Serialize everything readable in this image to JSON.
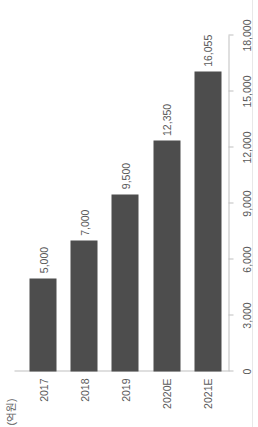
{
  "chart_data": {
    "type": "bar",
    "orientation": "vertical",
    "title": "",
    "subtitle": "",
    "xlabel": "",
    "ylabel": "(억원)",
    "unit_label": "(억원)",
    "categories": [
      "2017",
      "2018",
      "2019",
      "2020E",
      "2021E"
    ],
    "values": [
      5000,
      7000,
      9500,
      12350,
      16055
    ],
    "value_labels": [
      "5,000",
      "7,000",
      "9,500",
      "12,350",
      "16,055"
    ],
    "ylim": [
      0,
      18000
    ],
    "yticks": [
      0,
      3000,
      6000,
      9000,
      12000,
      15000,
      18000
    ],
    "ytick_labels": [
      "0",
      "3,000",
      "6,000",
      "9,000",
      "12,000",
      "15,000",
      "18,000"
    ],
    "grid": false,
    "legend": null,
    "series": [
      {
        "name": "",
        "values": [
          5000,
          7000,
          9500,
          12350,
          16055
        ],
        "color": "#4d4d4d"
      }
    ],
    "colors": {
      "bar": "#4d4d4d",
      "axis": "#bfbfbf",
      "text": "#595959",
      "background": "#ffffff"
    },
    "rotation": "page rotated 90 degrees counter-clockwise"
  },
  "page": {
    "background_color": "#ffffff",
    "edge_artifact_color": "#e8e8e8"
  }
}
